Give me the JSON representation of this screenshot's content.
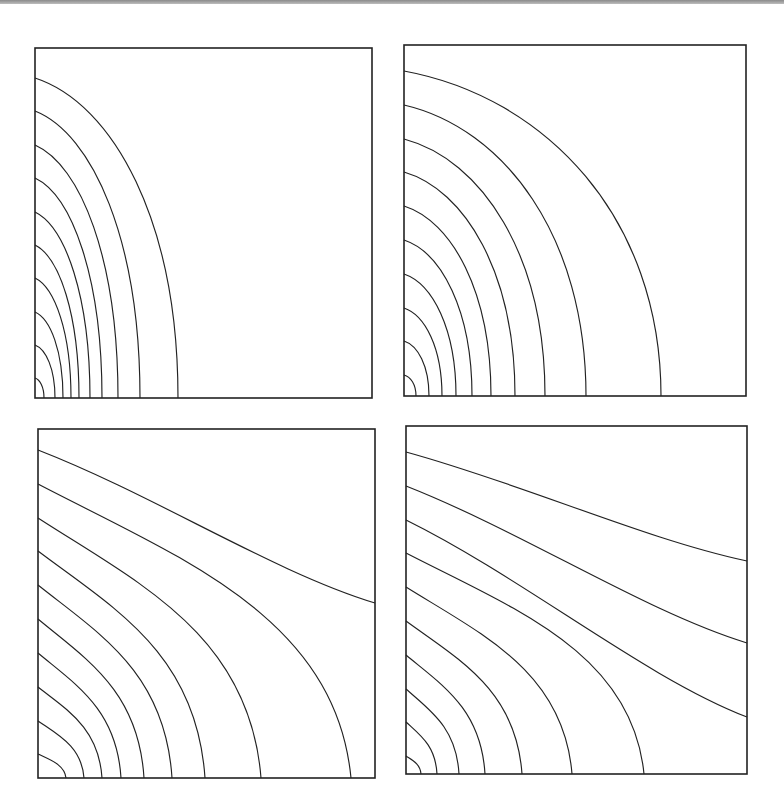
{
  "figure": {
    "panels": [
      {
        "id": "top-left",
        "box": {
          "x0": 35,
          "y0": 48,
          "x1": 372,
          "y1": 398
        },
        "contours": [
          {
            "start_y": 78,
            "end": {
              "edge": "bottom",
              "x": 178
            }
          },
          {
            "start_y": 111,
            "end": {
              "edge": "bottom",
              "x": 140
            }
          },
          {
            "start_y": 145,
            "end": {
              "edge": "bottom",
              "x": 118
            }
          },
          {
            "start_y": 178,
            "end": {
              "edge": "bottom",
              "x": 102
            }
          },
          {
            "start_y": 212,
            "end": {
              "edge": "bottom",
              "x": 90
            }
          },
          {
            "start_y": 245,
            "end": {
              "edge": "bottom",
              "x": 79
            }
          },
          {
            "start_y": 278,
            "end": {
              "edge": "bottom",
              "x": 71
            }
          },
          {
            "start_y": 312,
            "end": {
              "edge": "bottom",
              "x": 63
            }
          },
          {
            "start_y": 345,
            "end": {
              "edge": "bottom",
              "x": 55
            }
          },
          {
            "start_y": 378,
            "end": {
              "edge": "bottom",
              "x": 44
            }
          }
        ],
        "shape": "elliptic"
      },
      {
        "id": "top-right",
        "box": {
          "x0": 404,
          "y0": 45,
          "x1": 746,
          "y1": 396
        },
        "contours": [
          {
            "start_y": 71,
            "end": {
              "edge": "bottom",
              "x": 661
            }
          },
          {
            "start_y": 105,
            "end": {
              "edge": "bottom",
              "x": 586
            }
          },
          {
            "start_y": 139,
            "end": {
              "edge": "bottom",
              "x": 545
            }
          },
          {
            "start_y": 172,
            "end": {
              "edge": "bottom",
              "x": 515
            }
          },
          {
            "start_y": 206,
            "end": {
              "edge": "bottom",
              "x": 491
            }
          },
          {
            "start_y": 240,
            "end": {
              "edge": "bottom",
              "x": 472
            }
          },
          {
            "start_y": 274,
            "end": {
              "edge": "bottom",
              "x": 456
            }
          },
          {
            "start_y": 308,
            "end": {
              "edge": "bottom",
              "x": 442
            }
          },
          {
            "start_y": 341,
            "end": {
              "edge": "bottom",
              "x": 429
            }
          },
          {
            "start_y": 375,
            "end": {
              "edge": "bottom",
              "x": 416
            }
          }
        ],
        "shape": "elliptic"
      },
      {
        "id": "bottom-left",
        "box": {
          "x0": 38,
          "y0": 429,
          "x1": 375,
          "y1": 778
        },
        "contours": [
          {
            "start_y": 450,
            "end": {
              "edge": "right",
              "y": 603
            }
          },
          {
            "start_y": 484,
            "end": {
              "edge": "bottom",
              "x": 351
            }
          },
          {
            "start_y": 518,
            "end": {
              "edge": "bottom",
              "x": 261
            }
          },
          {
            "start_y": 551,
            "end": {
              "edge": "bottom",
              "x": 205
            }
          },
          {
            "start_y": 585,
            "end": {
              "edge": "bottom",
              "x": 172
            }
          },
          {
            "start_y": 619,
            "end": {
              "edge": "bottom",
              "x": 144
            }
          },
          {
            "start_y": 653,
            "end": {
              "edge": "bottom",
              "x": 121
            }
          },
          {
            "start_y": 687,
            "end": {
              "edge": "bottom",
              "x": 102
            }
          },
          {
            "start_y": 721,
            "end": {
              "edge": "bottom",
              "x": 84
            }
          },
          {
            "start_y": 754,
            "end": {
              "edge": "bottom",
              "x": 66
            }
          }
        ],
        "shape": "sigmoid"
      },
      {
        "id": "bottom-right",
        "box": {
          "x0": 406,
          "y0": 426,
          "x1": 747,
          "y1": 774
        },
        "contours": [
          {
            "start_y": 452,
            "end": {
              "edge": "right",
              "y": 561
            }
          },
          {
            "start_y": 486,
            "end": {
              "edge": "right",
              "y": 643
            }
          },
          {
            "start_y": 520,
            "end": {
              "edge": "right",
              "y": 717
            }
          },
          {
            "start_y": 553,
            "end": {
              "edge": "bottom",
              "x": 644
            }
          },
          {
            "start_y": 587,
            "end": {
              "edge": "bottom",
              "x": 572
            }
          },
          {
            "start_y": 621,
            "end": {
              "edge": "bottom",
              "x": 522
            }
          },
          {
            "start_y": 655,
            "end": {
              "edge": "bottom",
              "x": 485
            }
          },
          {
            "start_y": 689,
            "end": {
              "edge": "bottom",
              "x": 459
            }
          },
          {
            "start_y": 722,
            "end": {
              "edge": "bottom",
              "x": 437
            }
          },
          {
            "start_y": 756,
            "end": {
              "edge": "bottom",
              "x": 421
            }
          }
        ],
        "shape": "sigmoid"
      }
    ]
  },
  "colors": {
    "line": "#222222",
    "background": "#ffffff",
    "top_rule": "#9a9a9a"
  }
}
